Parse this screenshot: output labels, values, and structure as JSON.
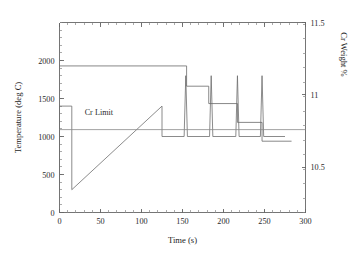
{
  "chart_data": {
    "type": "line",
    "title": "",
    "xlabel": "Time (s)",
    "ylabel": "Temperature (deg C)",
    "y2label": "Cr Weight %",
    "xlim": [
      0,
      300
    ],
    "ylim": [
      0,
      2500
    ],
    "y2lim": [
      10.1875,
      11.5
    ],
    "grid": false,
    "legend": "none",
    "xticks": [
      0,
      50,
      100,
      150,
      200,
      250,
      300
    ],
    "xticklabels": [
      "0",
      "50",
      "100",
      "150",
      "200",
      "250",
      "300"
    ],
    "yticks": [
      0,
      500,
      1000,
      1500,
      2000
    ],
    "yticklabels": [
      "0",
      "500",
      "1000",
      "1500",
      "2000"
    ],
    "y2ticks": [
      10.5,
      11,
      11.5
    ],
    "y2ticklabels": [
      "10.5",
      "11",
      "11.5"
    ],
    "xminor_interval": 10,
    "yminor_interval": 100,
    "y2minor_interval": 0.1,
    "annotations": [
      {
        "name": "cr-limit-label",
        "text": "Cr Limit",
        "x": 48,
        "y": 10.86
      }
    ],
    "series": [
      {
        "name": "Temperature",
        "axis": "left",
        "units": "deg C",
        "points": [
          [
            0,
            300
          ],
          [
            0,
            1400
          ],
          [
            15,
            1400
          ],
          [
            15,
            300
          ],
          [
            125,
            1400
          ],
          [
            125,
            1000
          ],
          [
            152,
            1000
          ],
          [
            154,
            1800
          ],
          [
            156,
            1000
          ],
          [
            183,
            1000
          ],
          [
            185,
            1800
          ],
          [
            187,
            1000
          ],
          [
            215,
            1000
          ],
          [
            217,
            1800
          ],
          [
            219,
            1000
          ],
          [
            245,
            1000
          ],
          [
            247,
            1800
          ],
          [
            249,
            1000
          ],
          [
            275,
            1000
          ]
        ]
      },
      {
        "name": "Cr Weight %",
        "axis": "right",
        "units": "%",
        "points": [
          [
            0,
            11.2
          ],
          [
            155,
            11.2
          ],
          [
            155,
            11.06
          ],
          [
            182,
            11.06
          ],
          [
            182,
            10.94
          ],
          [
            217,
            10.94
          ],
          [
            217,
            10.81
          ],
          [
            247,
            10.81
          ],
          [
            247,
            10.68
          ],
          [
            283,
            10.68
          ]
        ]
      },
      {
        "name": "Cr Limit",
        "axis": "right",
        "units": "%",
        "points": [
          [
            0,
            10.76
          ],
          [
            300,
            10.76
          ]
        ]
      }
    ]
  }
}
